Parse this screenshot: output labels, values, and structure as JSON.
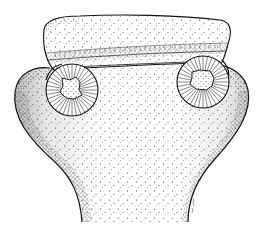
{
  "figure": {
    "subject": "stippled pen-and-ink drawing of a scolex with two suckers",
    "background_color": "#ffffff",
    "ink_color": "#1a1a1a",
    "parts": {
      "apical_cap": "apical cap",
      "left_sucker": "left sucker",
      "right_sucker": "right sucker",
      "neck": "neck"
    },
    "signature": ""
  }
}
